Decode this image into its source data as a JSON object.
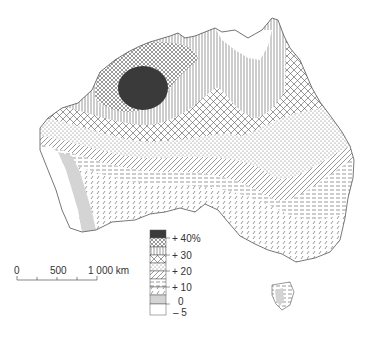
{
  "map": {
    "subject": "Australia",
    "legend": {
      "unit": "%",
      "classes": [
        {
          "pattern": "solid-dark",
          "color": "#3a3a3a"
        },
        {
          "pattern": "fine-crosshatch"
        },
        {
          "pattern": "vertical-lines"
        },
        {
          "pattern": "diamond-crosshatch"
        },
        {
          "pattern": "dots"
        },
        {
          "pattern": "diagonal-lines"
        },
        {
          "pattern": "horizontal-dashes"
        },
        {
          "pattern": "small-diagonal-dashes"
        },
        {
          "pattern": "light-gray",
          "color": "#d4d4d4"
        },
        {
          "pattern": "white",
          "color": "#ffffff"
        }
      ],
      "labels": [
        "+ 40%",
        "+ 30",
        "+ 20",
        "+ 10",
        "0",
        "– 5"
      ]
    },
    "scale_bar": {
      "labels": [
        "0",
        "500",
        "1 000 km"
      ]
    }
  }
}
